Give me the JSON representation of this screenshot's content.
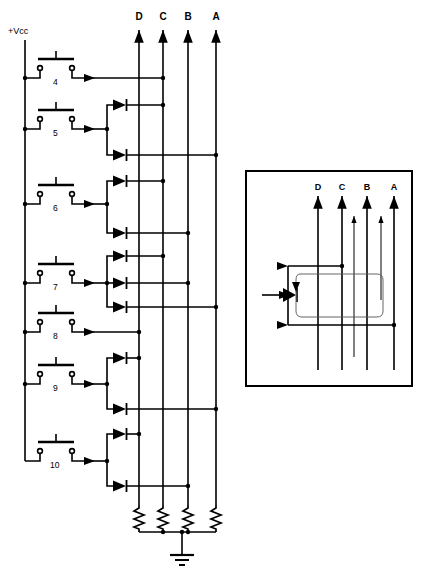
{
  "diagram": {
    "type": "electronic-schematic",
    "power_rail_label": "+Vcc",
    "ground_symbol": "earth-ground",
    "stroke_color": "#000000",
    "background_color": "#ffffff",
    "output_columns": [
      {
        "label": "D",
        "x": 139
      },
      {
        "label": "C",
        "x": 163
      },
      {
        "label": "B",
        "x": 188
      },
      {
        "label": "A",
        "x": 216
      }
    ],
    "switches": [
      {
        "label": "4",
        "y": 78,
        "type": "push-button-normally-open"
      },
      {
        "label": "5",
        "y": 129,
        "type": "push-button-normally-open"
      },
      {
        "label": "6",
        "y": 204,
        "type": "push-button-normally-open"
      },
      {
        "label": "7",
        "y": 283,
        "type": "push-button-normally-open"
      },
      {
        "label": "8",
        "y": 332,
        "type": "push-button-normally-open"
      },
      {
        "label": "9",
        "y": 384,
        "type": "push-button-normally-open"
      },
      {
        "label": "10",
        "y": 461,
        "type": "push-button-normally-open"
      }
    ],
    "connections": [
      {
        "switch": "4",
        "direct_to": "C",
        "diodes": []
      },
      {
        "switch": "5",
        "direct_to": null,
        "diodes": [
          "C",
          "A"
        ]
      },
      {
        "switch": "6",
        "direct_to": null,
        "diodes": [
          "C",
          "B"
        ]
      },
      {
        "switch": "7",
        "direct_to": null,
        "diodes": [
          "C",
          "B",
          "A"
        ]
      },
      {
        "switch": "8",
        "direct_to": "D",
        "diodes": []
      },
      {
        "switch": "9",
        "direct_to": null,
        "diodes": [
          "D",
          "A"
        ]
      },
      {
        "switch": "10",
        "direct_to": null,
        "diodes": [
          "D",
          "B"
        ]
      }
    ],
    "pulldown_resistors": {
      "count": 4,
      "columns": [
        "D",
        "C",
        "B",
        "A"
      ]
    }
  },
  "inset": {
    "caption": "",
    "border_color": "#000000",
    "columns": [
      {
        "label": "D",
        "x": 318
      },
      {
        "label": "C",
        "x": 342
      },
      {
        "label": "B",
        "x": 367
      },
      {
        "label": "A",
        "x": 394
      }
    ],
    "diode_symbol": "filled-diode",
    "current_path": "rounded-loop"
  }
}
